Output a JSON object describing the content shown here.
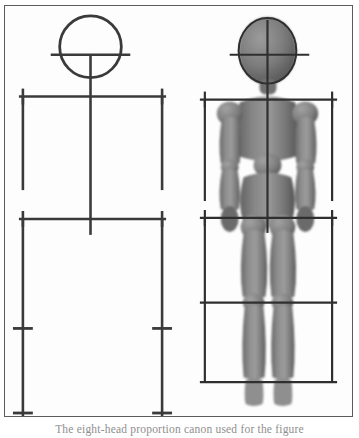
{
  "plate": {
    "caption": "The eight-head proportion canon used for the figure",
    "frame_color": "#5c5c5c",
    "background_color": "#ffffff",
    "paper_color": "#fdfdfd"
  },
  "diagram": {
    "line_color": "#3a3a3a",
    "mannequin_color": "#808080",
    "mannequin_shadow_color": "#5e5e5e",
    "mannequin_highlight_color": "#a9a9a9",
    "stick_figure": {
      "label": "Proportion skeleton diagram",
      "head_circle": {
        "cx": 90,
        "cy": 44,
        "r": 33
      },
      "eye_line": {
        "x1": 50,
        "x2": 130,
        "y": 52
      },
      "spine": {
        "x": 90,
        "y1": 52,
        "y2": 235
      },
      "shoulder_line": {
        "x1": 18,
        "x2": 166,
        "y": 96
      },
      "shoulder_tick_left": {
        "x": 22,
        "y1": 88,
        "y2": 104
      },
      "shoulder_tick_right": {
        "x": 162,
        "y1": 88,
        "y2": 104
      },
      "arm_left": {
        "x": 22,
        "y1": 96,
        "y2": 190
      },
      "arm_right": {
        "x": 162,
        "y1": 96,
        "y2": 190
      },
      "hip_line": {
        "x1": 18,
        "x2": 166,
        "y": 219
      },
      "hip_tick_left": {
        "x": 22,
        "y1": 211,
        "y2": 227
      },
      "hip_tick_right": {
        "x": 162,
        "y1": 211,
        "y2": 227
      },
      "leg_left": {
        "x": 22,
        "y1": 219,
        "y2": 424
      },
      "leg_right": {
        "x": 162,
        "y1": 219,
        "y2": 424
      },
      "knee_tick_left": {
        "x1": 12,
        "x2": 32,
        "y": 329
      },
      "knee_tick_right": {
        "x1": 152,
        "x2": 172,
        "y": 329
      },
      "ankle_tick_left": {
        "x1": 12,
        "x2": 32,
        "y": 417
      },
      "ankle_tick_right": {
        "x1": 152,
        "x2": 172,
        "y": 417
      }
    },
    "mannequin": {
      "label": "Wooden artist mannequin with proportion overlay",
      "center_x": 272,
      "head_ellipse": {
        "cx": 268,
        "cy": 48,
        "rx": 30,
        "ry": 35
      },
      "eye_line": {
        "x1": 230,
        "x2": 312,
        "y": 52
      },
      "spine": {
        "x": 268,
        "y1": 20,
        "y2": 230
      },
      "shoulder_line": {
        "x1": 200,
        "x2": 338,
        "y": 99
      },
      "shoulder_tick_left": {
        "x": 205,
        "y1": 91,
        "y2": 107
      },
      "shoulder_tick_right": {
        "x": 333,
        "y1": 91,
        "y2": 107
      },
      "arm_left": {
        "x": 205,
        "y1": 99,
        "y2": 200
      },
      "arm_right": {
        "x": 333,
        "y1": 99,
        "y2": 200
      },
      "hip_line": {
        "x1": 200,
        "x2": 338,
        "y": 218
      },
      "hip_tick_left": {
        "x": 205,
        "y1": 210,
        "y2": 226
      },
      "hip_tick_right": {
        "x": 333,
        "y1": 210,
        "y2": 226
      },
      "leg_left": {
        "x": 205,
        "y1": 218,
        "y2": 383
      },
      "leg_right": {
        "x": 333,
        "y1": 218,
        "y2": 383
      },
      "knee_line": {
        "x1": 200,
        "x2": 338,
        "y": 303
      },
      "ankle_line": {
        "x1": 200,
        "x2": 338,
        "y": 383
      }
    }
  }
}
